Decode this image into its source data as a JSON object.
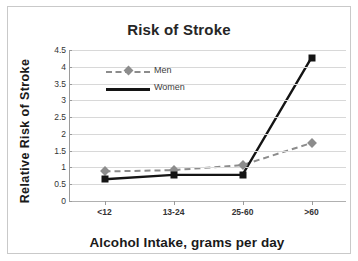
{
  "chart_data": {
    "type": "line",
    "title": "Risk of Stroke",
    "xlabel": "Alcohol Intake, grams per day",
    "ylabel": "Relative Risk  of  Stroke",
    "categories": [
      "<12",
      "13-24",
      "25-60",
      ">60"
    ],
    "ylim": [
      0,
      4.5
    ],
    "ytick_labels": [
      "0",
      "0.5",
      "1",
      "1.5",
      "2",
      "2.5",
      "3",
      "3.5",
      "4",
      "4.5"
    ],
    "ytick_values": [
      0,
      0.5,
      1,
      1.5,
      2,
      2.5,
      3,
      3.5,
      4,
      4.5
    ],
    "grid": true,
    "legend_position": "upper-left-inside",
    "series": [
      {
        "name": "Men",
        "values": [
          0.88,
          0.92,
          1.07,
          1.73
        ],
        "color": "#8c8c8c",
        "line_style": "dashed",
        "marker": "diamond"
      },
      {
        "name": "Women",
        "values": [
          0.65,
          0.78,
          0.78,
          4.27
        ],
        "color": "#141414",
        "line_style": "solid",
        "marker": "square"
      }
    ]
  },
  "colors": {
    "frame_border": "#c9c9c9",
    "gridline": "#d8d8d8",
    "axis": "#9a9a9a",
    "title_text": "#262626",
    "men": "#8c8c8c",
    "women": "#141414"
  }
}
